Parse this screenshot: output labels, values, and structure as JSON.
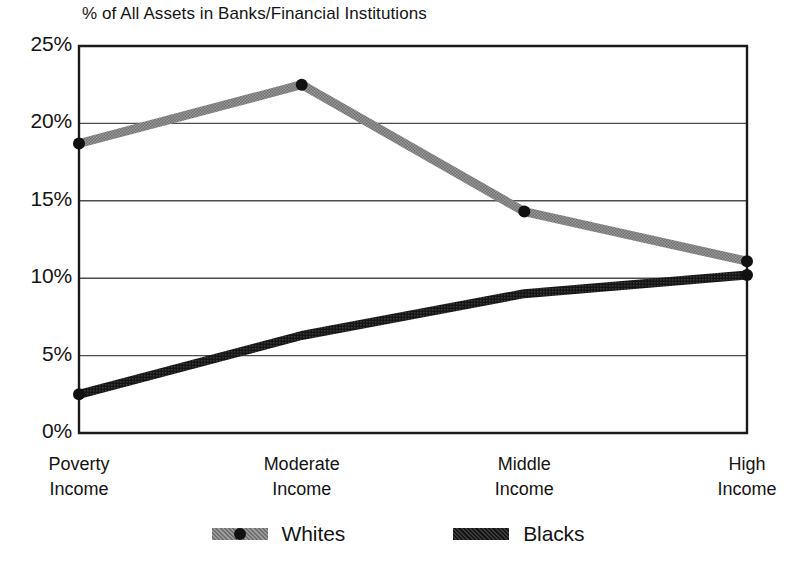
{
  "chart_data": {
    "type": "line",
    "title": "% of All Assets in Banks/Financial Institutions",
    "xlabel": "",
    "ylabel": "",
    "categories": [
      "Poverty Income",
      "Moderate Income",
      "Middle Income",
      "High Income"
    ],
    "category_lines": [
      [
        "Poverty",
        "Income"
      ],
      [
        "Moderate",
        "Income"
      ],
      [
        "Middle",
        "Income"
      ],
      [
        "High",
        "Income"
      ]
    ],
    "series": [
      {
        "name": "Whites",
        "values": [
          18.7,
          22.5,
          14.3,
          11.1
        ],
        "color": "#8c8c8c",
        "markers": true
      },
      {
        "name": "Blacks",
        "values": [
          2.5,
          6.3,
          9.0,
          10.2
        ],
        "color": "#111111",
        "markers": false
      }
    ],
    "ylim": [
      0,
      25
    ],
    "yticks": [
      0,
      5,
      10,
      15,
      20,
      25
    ],
    "ytick_labels": [
      "0%",
      "5%",
      "10%",
      "15%",
      "20%",
      "25%"
    ],
    "grid": true,
    "legend_position": "bottom"
  },
  "legend": {
    "items": [
      {
        "label": "Whites",
        "swatch": "gray-line-with-dot"
      },
      {
        "label": "Blacks",
        "swatch": "black-thick-line"
      }
    ]
  },
  "colors": {
    "whites_series": "#8c8c8c",
    "blacks_series": "#111111",
    "axis": "#1a1a1a",
    "gridline": "#4d4d4d",
    "background": "#ffffff"
  }
}
